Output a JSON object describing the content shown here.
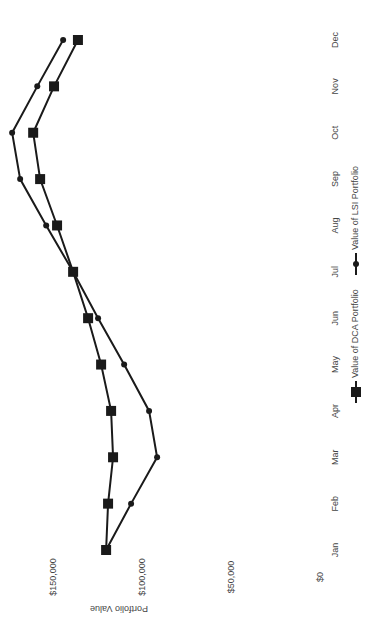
{
  "chart_data": {
    "type": "line",
    "title": "",
    "xlabel": "",
    "ylabel": "Portfolio Value",
    "categories": [
      "Jan",
      "Feb",
      "Mar",
      "Apr",
      "May",
      "Jun",
      "Jul",
      "Aug",
      "Sep",
      "Oct",
      "Nov",
      "Dec"
    ],
    "ylim": [
      0,
      150000
    ],
    "yticks": [
      0,
      50000,
      100000,
      150000
    ],
    "ytick_labels": [
      "$0",
      "$50,000",
      "$100,000",
      "$150,000"
    ],
    "grid": false,
    "legend_position": "bottom",
    "orientation": "rotated 90° counter-clockwise",
    "series": [
      {
        "name": "Value of DCA Portfolio",
        "marker": "square",
        "color": "#1a1a1a",
        "values": [
          120500,
          119400,
          116600,
          117700,
          123300,
          130600,
          139000,
          148000,
          157500,
          161400,
          149700,
          136300
        ]
      },
      {
        "name": "Value of LSI Portfolio",
        "marker": "circle",
        "color": "#1a1a1a",
        "values": [
          120500,
          106500,
          91900,
          96400,
          110400,
          125000,
          139000,
          154100,
          168700,
          173200,
          159100,
          144600
        ]
      }
    ]
  }
}
